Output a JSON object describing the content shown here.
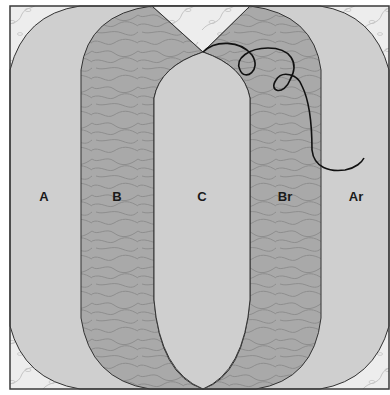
{
  "diagram": {
    "pieces": [
      {
        "id": "A",
        "label": "A"
      },
      {
        "id": "B",
        "label": "B"
      },
      {
        "id": "C",
        "label": "C"
      },
      {
        "id": "Br",
        "label": "Br"
      },
      {
        "id": "Ar",
        "label": "Ar"
      }
    ],
    "colors": {
      "frame": "#3a3a3a",
      "background_print": "#ededed",
      "solid_piece": "#cfcfcf",
      "textured_piece": "#a9a9a9",
      "outline": "#333333",
      "thread": "#111111"
    }
  }
}
